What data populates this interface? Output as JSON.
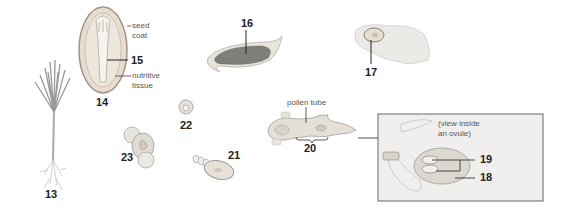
{
  "diagram": {
    "type": "plant life cycle (gymnosperm/angiosperm reproduction stages)",
    "stages": [
      {
        "id": "13",
        "label": "13",
        "depicts": "seedling plant"
      },
      {
        "id": "14",
        "label": "14",
        "depicts": "seed (cross-section)"
      },
      {
        "id": "15",
        "label": "15",
        "depicts": "embryo inside seed"
      },
      {
        "id": "16",
        "label": "16",
        "depicts": "sporangium / anther"
      },
      {
        "id": "17",
        "label": "17",
        "depicts": "ovule on cone scale"
      },
      {
        "id": "18",
        "label": "18",
        "depicts": "female gametophyte"
      },
      {
        "id": "19",
        "label": "19",
        "depicts": "egg cells"
      },
      {
        "id": "20",
        "label": "20",
        "depicts": "pollen grain with pollen tube"
      },
      {
        "id": "21",
        "label": "21",
        "depicts": "zygote / early embryo"
      },
      {
        "id": "22",
        "label": "22",
        "depicts": "dividing cell"
      },
      {
        "id": "23",
        "label": "23",
        "depicts": "developing embryo"
      }
    ],
    "annotations": {
      "seed_coat": "seed\ncoat",
      "seed_coat_l1": "seed",
      "seed_coat_l2": "coat",
      "nutritive_l1": "nutritive",
      "nutritive_l2": "tissue",
      "pollen_tube": "pollen tube",
      "inset_l1": "(view inside",
      "inset_l2": "an ovule)"
    }
  }
}
